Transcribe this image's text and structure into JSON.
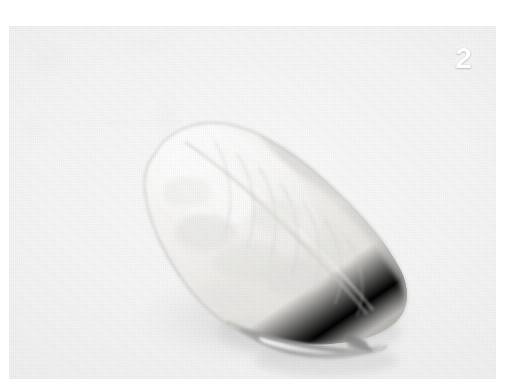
{
  "plate": {
    "specimen_number": "2",
    "background_color": "#f3f3f3",
    "page_color": "#ffffff",
    "specimen_color": "#f0efec",
    "shadow_color": "#d9d9d9",
    "aperture_color": "#9a9a9a",
    "number_color": "#fdfdfd"
  },
  "photo": {
    "subject": "shell-specimen",
    "orientation": "diagonal-upper-left-to-lower-right",
    "frame_left": 9,
    "frame_top": 26,
    "frame_width": 487,
    "frame_height": 353
  },
  "icons": {
    "specimen": "shell-icon",
    "number_label": "specimen-number-label"
  }
}
